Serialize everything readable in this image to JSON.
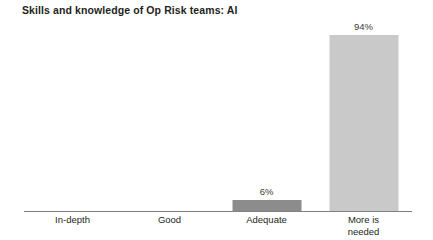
{
  "chart_data": {
    "type": "bar",
    "title": "Skills and knowledge of Op Risk teams: AI",
    "xlabel": "",
    "ylabel": "",
    "ylim": [
      0,
      100
    ],
    "grid": false,
    "legend": "none",
    "orientation": "vertical",
    "categories": [
      "In-depth",
      "Good",
      "Adequate",
      "More is\nneeded"
    ],
    "values": [
      0,
      0,
      6,
      94
    ],
    "value_labels": [
      "",
      "",
      "6%",
      "94%"
    ],
    "bars": [
      {
        "category": "In-depth",
        "category_line1": "In-depth",
        "category_line2": "",
        "value": 0,
        "value_label": "",
        "color": "#8c8c8c",
        "visible": false
      },
      {
        "category": "Good",
        "category_line1": "Good",
        "category_line2": "",
        "value": 0,
        "value_label": "",
        "color": "#8c8c8c",
        "visible": false
      },
      {
        "category": "Adequate",
        "category_line1": "Adequate",
        "category_line2": "",
        "value": 6,
        "value_label": "6%",
        "color": "#8c8c8c",
        "visible": true
      },
      {
        "category": "More is needed",
        "category_line1": "More is",
        "category_line2": "needed",
        "value": 94,
        "value_label": "94%",
        "color": "#c9c9c9",
        "visible": true
      }
    ],
    "colors": {
      "background": "#ffffff",
      "title_text": "#231f20",
      "axis_line": "#808080",
      "tick_label_text": "#231f20",
      "value_label_text": "#3a3a3a",
      "bar_adequate": "#8c8c8c",
      "bar_more_is_needed": "#c9c9c9"
    }
  }
}
